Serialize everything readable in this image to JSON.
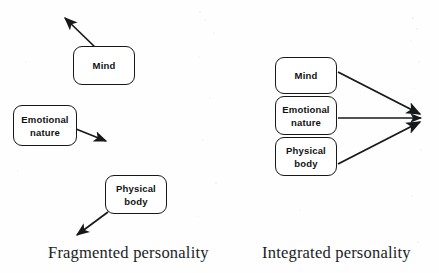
{
  "figure": {
    "background_color": "#fefefe",
    "ink_color": "#16181a"
  },
  "panels": [
    {
      "id": "fragmented",
      "caption": "Fragmented personality",
      "caption_x": 48,
      "caption_y": 243,
      "nodes": [
        {
          "id": "mind-left",
          "label": "Mind",
          "x": 73,
          "y": 46,
          "w": 62,
          "h": 39
        },
        {
          "id": "emotional-nature-left",
          "label": "Emotional\nnature",
          "x": 13,
          "y": 105,
          "w": 64,
          "h": 41
        },
        {
          "id": "physical-body-left",
          "label": "Physical\nbody",
          "x": 105,
          "y": 175,
          "w": 62,
          "h": 39
        }
      ],
      "arrows": [
        {
          "id": "arrow-mind-left",
          "x1": 98,
          "y1": 50,
          "x2": 62,
          "y2": 15
        },
        {
          "id": "arrow-emotional-left",
          "x1": 76,
          "y1": 129,
          "x2": 110,
          "y2": 143
        },
        {
          "id": "arrow-physical-left",
          "x1": 108,
          "y1": 212,
          "x2": 73,
          "y2": 238
        }
      ]
    },
    {
      "id": "integrated",
      "caption": "Integrated personality",
      "caption_x": 262,
      "caption_y": 243,
      "nodes": [
        {
          "id": "mind-right",
          "label": "Mind",
          "x": 275,
          "y": 57,
          "w": 62,
          "h": 37
        },
        {
          "id": "emotional-nature-right",
          "label": "Emotional\nnature",
          "x": 275,
          "y": 96,
          "w": 62,
          "h": 39
        },
        {
          "id": "physical-body-right",
          "label": "Physical\nbody",
          "x": 275,
          "y": 137,
          "w": 62,
          "h": 39
        }
      ],
      "arrows": [
        {
          "id": "arrow-mind-right",
          "x1": 338,
          "y1": 72,
          "x2": 427,
          "y2": 117
        },
        {
          "id": "arrow-emotional-right",
          "x1": 338,
          "y1": 117,
          "x2": 427,
          "y2": 117
        },
        {
          "id": "arrow-physical-right",
          "x1": 338,
          "y1": 164,
          "x2": 427,
          "y2": 119
        }
      ],
      "convergence_point": {
        "x": 428,
        "y": 118
      }
    }
  ]
}
